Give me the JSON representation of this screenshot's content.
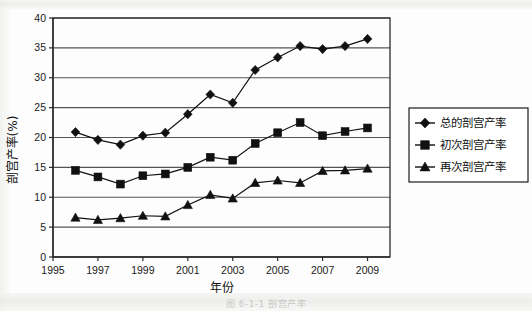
{
  "figure": {
    "caption": "图 6-1-1  剖宫产率"
  },
  "axes": {
    "ylabel": "剖宫产率(%)",
    "xlabel": "年份",
    "y_ticks": [
      "0",
      "5",
      "10",
      "15",
      "20",
      "25",
      "30",
      "35",
      "40"
    ],
    "x_ticks": [
      "1995",
      "1997",
      "1999",
      "2001",
      "2003",
      "2005",
      "2007",
      "2009"
    ]
  },
  "legend": {
    "position": "right",
    "items": [
      {
        "label": "总的剖宫产率",
        "marker": "diamond"
      },
      {
        "label": "初次剖宫产率",
        "marker": "square"
      },
      {
        "label": "再次剖宫产率",
        "marker": "triangle"
      }
    ]
  },
  "chart_data": {
    "type": "line",
    "title": "",
    "xlabel": "年份",
    "ylabel": "剖宫产率(%)",
    "xlim": [
      1995,
      2010
    ],
    "ylim": [
      0,
      40
    ],
    "grid": true,
    "x": [
      1996,
      1997,
      1998,
      1999,
      2000,
      2001,
      2002,
      2003,
      2004,
      2005,
      2006,
      2007,
      2008,
      2009
    ],
    "series": [
      {
        "name": "总的剖宫产率",
        "marker": "diamond",
        "values": [
          20.9,
          19.6,
          18.8,
          20.3,
          20.8,
          23.9,
          27.2,
          25.8,
          31.3,
          33.4,
          35.3,
          34.8,
          35.3,
          36.5
        ]
      },
      {
        "name": "初次剖宫产率",
        "marker": "square",
        "values": [
          14.5,
          13.4,
          12.2,
          13.6,
          13.9,
          15.0,
          16.7,
          16.2,
          19.0,
          20.8,
          22.5,
          20.3,
          21.0,
          21.6
        ]
      },
      {
        "name": "再次剖宫产率",
        "marker": "triangle",
        "values": [
          6.6,
          6.2,
          6.5,
          6.9,
          6.8,
          8.7,
          10.4,
          9.8,
          12.4,
          12.8,
          12.4,
          14.4,
          14.5,
          14.8
        ]
      }
    ]
  }
}
